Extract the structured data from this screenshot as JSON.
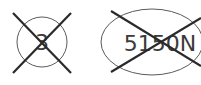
{
  "symbols": [
    {
      "shape": "circle",
      "label": "3",
      "crossed_out": true
    },
    {
      "shape": "ellipse",
      "label": "5150N",
      "crossed_out": true
    }
  ],
  "colors": {
    "outline": "#5a5a5a",
    "cross": "#2a2a2a",
    "text": "#3a3a3a"
  }
}
